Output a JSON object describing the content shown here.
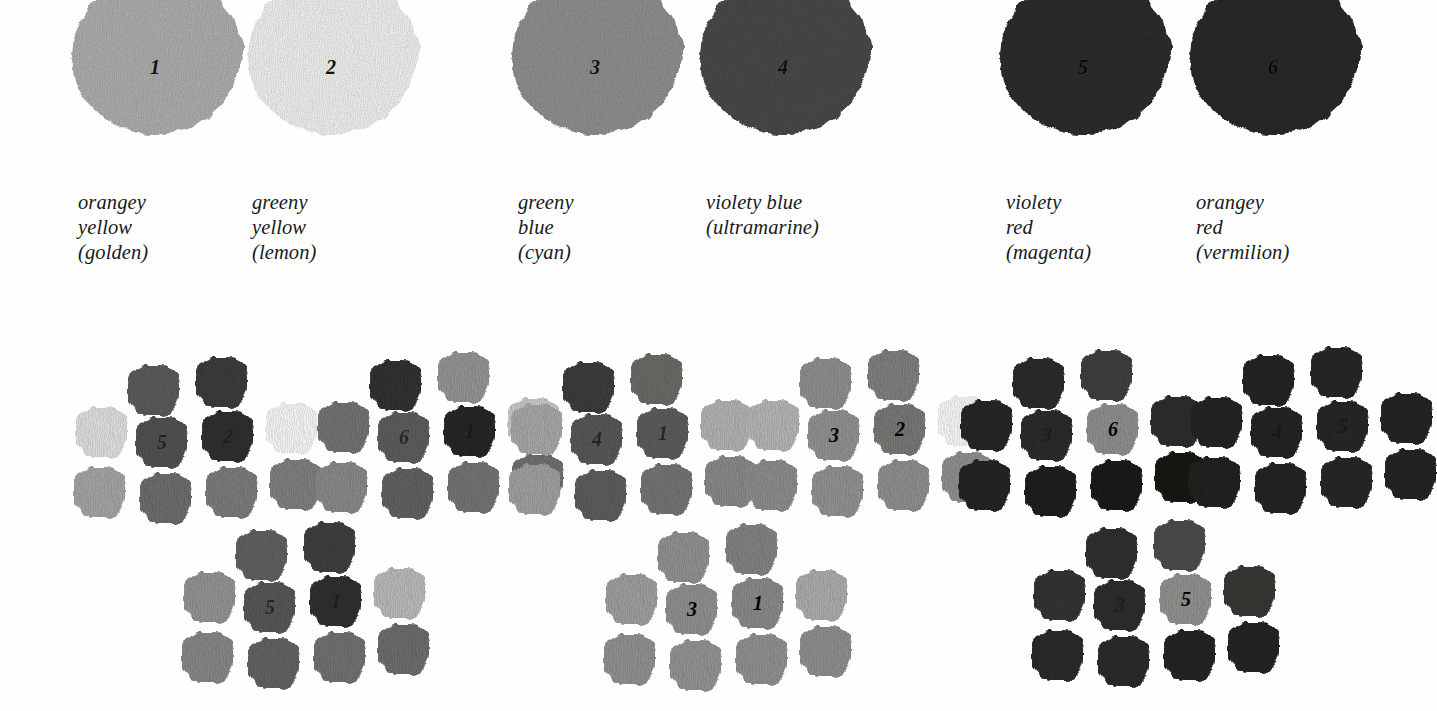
{
  "figure": {
    "background_color": "#fefefe",
    "ink_color": "#1a1a1a"
  },
  "swatches": {
    "items": [
      {
        "number": "1",
        "name_line1": "orangey yellow",
        "name_line2": "(golden)",
        "caption": "orangey yellow\n(golden)",
        "gray_hex": "#a9a9a7",
        "number_style": "normal"
      },
      {
        "number": "2",
        "name_line1": "greeny yellow",
        "name_line2": "(lemon)",
        "caption": "greeny yellow\n(lemon)",
        "gray_hex": "#e9e9e7",
        "number_style": "normal"
      },
      {
        "number": "3",
        "name_line1": "greeny  blue",
        "name_line2": "(cyan)",
        "caption": "greeny  blue\n(cyan)",
        "gray_hex": "#8b8b89",
        "number_style": "normal"
      },
      {
        "number": "4",
        "name_line1": "violety blue",
        "name_line2": "(ultramarine)",
        "caption": "violety blue\n(ultramarine)",
        "gray_hex": "#474745",
        "number_style": "dark"
      },
      {
        "number": "5",
        "name_line1": "violety red",
        "name_line2": "(magenta)",
        "caption": "violety red\n(magenta)",
        "gray_hex": "#2b2b29",
        "number_style": "dark"
      },
      {
        "number": "6",
        "name_line1": "orangey  red",
        "name_line2": "(vermilion)",
        "caption": "orangey  red\n(vermilion)",
        "gray_hex": "#282826",
        "number_style": "dark"
      }
    ]
  },
  "clusters": {
    "items": [
      {
        "id": "cluster-a",
        "group": "left",
        "labels": [
          "5",
          "2"
        ],
        "patch_grays": [
          "#585856",
          "#3a3a38",
          "#d8d8d6",
          "#4f4f4d",
          "#2e2e2c",
          "#efefed",
          "#a0a09e",
          "#6a6a68",
          "#787876",
          "#7b7b79"
        ],
        "label_positions": [
          4,
          5
        ]
      },
      {
        "id": "cluster-b",
        "group": "left",
        "labels": [
          "6",
          "1"
        ],
        "patch_grays": [
          "#303030",
          "#909090",
          "#6f6f6f",
          "#5a5a5a",
          "#262626",
          "#c3c3c3",
          "#858585",
          "#5e5e5e",
          "#707070",
          "#6d6d6d"
        ],
        "label_positions": [
          4,
          5
        ]
      },
      {
        "id": "cluster-c",
        "group": "left",
        "labels": [
          "5",
          "1"
        ],
        "patch_grays": [
          "#5d5d5b",
          "#3c3c3a",
          "#8f8f8d",
          "#55555 3",
          "#2f2f2d",
          "#b4b4b2",
          "#838381",
          "#606060",
          "#6e6e6c",
          "#6a6a68"
        ],
        "label_positions": [
          4,
          5
        ]
      },
      {
        "id": "cluster-d",
        "group": "middle",
        "labels": [
          "4",
          "1"
        ],
        "patch_grays": [
          "#3b3b39",
          "#666664",
          "#a2a2a0",
          "#545452",
          "#59595 7",
          "#adadab",
          "#9b9b99",
          "#5a5a58",
          "#707070",
          "#858583"
        ],
        "label_positions": [
          4,
          5
        ]
      },
      {
        "id": "cluster-e",
        "group": "middle",
        "labels": [
          "3",
          "2"
        ],
        "patch_grays": [
          "#8a8a88",
          "#7b7b79",
          "#b0b0ae",
          "#8d8d8b",
          "#74747 2",
          "#f0f0ee",
          "#888886",
          "#8e8e8c",
          "#8a8a88",
          "#8b8b89"
        ],
        "label_positions": [
          4,
          5
        ]
      },
      {
        "id": "cluster-f",
        "group": "middle",
        "labels": [
          "3",
          "1"
        ],
        "patch_grays": [
          "#8d8d8b",
          "#7f7f7d",
          "#9a9a98",
          "#8b8b89",
          "#85858 3",
          "#a7a7a5",
          "#8d8d8b",
          "#8f8f8d",
          "#8c8c8a",
          "#8a8a88"
        ],
        "label_positions": [
          4,
          5
        ]
      },
      {
        "id": "cluster-g",
        "group": "right",
        "labels": [
          "3",
          "6"
        ],
        "patch_grays": [
          "#2b2b29",
          "#3d3d3b",
          "#252523",
          "#2a2a28",
          "#8a8a88",
          "#2c2c2a",
          "#222220",
          "#1e1e1c",
          "#1a1a18",
          "#141412"
        ],
        "label_positions": [
          4,
          5
        ]
      },
      {
        "id": "cluster-h",
        "group": "right",
        "labels": [
          "4",
          "5"
        ],
        "patch_grays": [
          "#242422",
          "#262624",
          "#222220",
          "#232321",
          "#262624",
          "#242422",
          "#212 11f",
          "#232321",
          "#252523",
          "#222220"
        ],
        "label_positions": [
          4,
          5
        ]
      },
      {
        "id": "cluster-i",
        "group": "right",
        "labels": [
          "3",
          "5"
        ],
        "patch_grays": [
          "#2e2e2c",
          "#4a4a48",
          "#333331",
          "#2c2c2a",
          "#8d8d8b",
          "#343432",
          "#2a2a28",
          "#2b2b29",
          "#222220",
          "#242422"
        ],
        "label_positions": [
          4,
          5
        ]
      }
    ]
  }
}
